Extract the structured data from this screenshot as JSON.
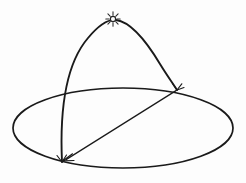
{
  "figure": {
    "title": "Celestial dome with sun path over horizon plane",
    "background_color": "#fdfdfd",
    "ink_color": "#1a1a1a",
    "width": 246,
    "height": 183
  },
  "elements": {
    "horizon_ellipse": {
      "name": "horizon-circle",
      "center_x": 123,
      "center_y": 128,
      "radius_x": 110,
      "radius_y": 40,
      "stroke_width": 1.7
    },
    "meridian_arc": {
      "name": "sun-path-arc",
      "start_x": 62,
      "start_y": 162,
      "apex_x": 113,
      "apex_y": 19,
      "end_x": 177,
      "end_y": 90,
      "stroke_width": 1.9
    },
    "chord_arrow": {
      "name": "sight-line",
      "from_x": 177,
      "from_y": 90,
      "to_x": 62,
      "to_y": 162,
      "stroke_width": 1.25,
      "arrowhead_at": "to"
    },
    "sun_symbol": {
      "name": "sun-glyph",
      "center_x": 113,
      "center_y": 19,
      "core_radius": 2.6,
      "ray_count": 8,
      "ray_inner": 3.8,
      "ray_outer": 7.2
    },
    "marker_right": {
      "name": "intersection-marker-right",
      "x": 177,
      "y": 90
    },
    "marker_bottom_left": {
      "name": "intersection-marker-bottom-left",
      "x": 62,
      "y": 162
    }
  },
  "labels": {
    "figure_caption": "",
    "axis_labels": [],
    "legend": []
  }
}
